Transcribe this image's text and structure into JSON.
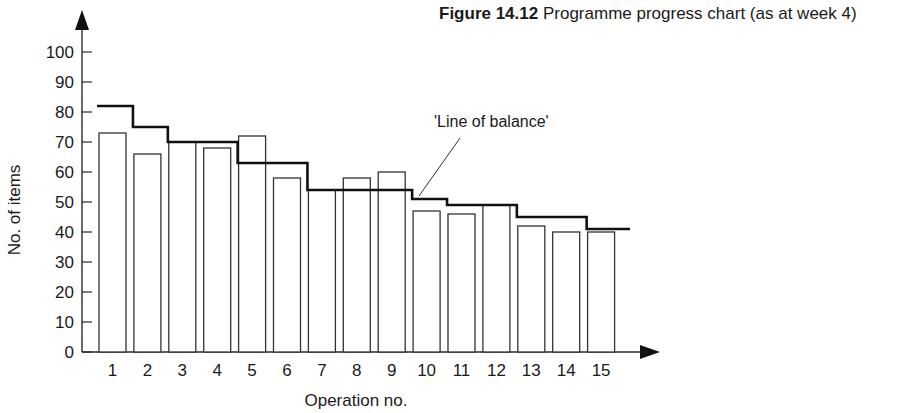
{
  "figure": {
    "number": "Figure 14.12",
    "caption": "Programme progress chart (as at week 4)"
  },
  "chart_data": {
    "type": "bar",
    "title": "Programme progress chart (as at week 4)",
    "xlabel": "Operation no.",
    "ylabel": "No. of items",
    "ylim": [
      0,
      100
    ],
    "yticks": [
      0,
      10,
      20,
      30,
      40,
      50,
      60,
      70,
      80,
      90,
      100
    ],
    "categories": [
      "1",
      "2",
      "3",
      "4",
      "5",
      "6",
      "7",
      "8",
      "9",
      "10",
      "11",
      "12",
      "13",
      "14",
      "15"
    ],
    "series": [
      {
        "name": "Items completed",
        "style": "bar",
        "values": [
          73,
          66,
          70,
          68,
          72,
          58,
          54,
          58,
          60,
          47,
          46,
          49,
          42,
          40,
          40
        ]
      },
      {
        "name": "Line of balance",
        "style": "step",
        "values": [
          82,
          75,
          70,
          70,
          63,
          63,
          54,
          54,
          54,
          51,
          49,
          49,
          45,
          45,
          41
        ]
      }
    ],
    "annotations": [
      {
        "text": "'Line of balance'",
        "target_category": "10"
      }
    ],
    "grid": false,
    "legend": "none"
  }
}
